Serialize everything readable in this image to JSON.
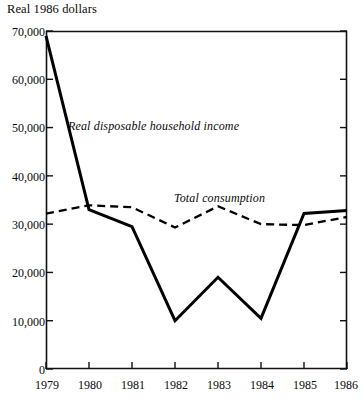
{
  "chart_data": {
    "type": "line",
    "title": "",
    "subtitle": "",
    "ylabel": "Real 1986 dollars",
    "xlabel": "",
    "x": [
      1979,
      1980,
      1981,
      1982,
      1983,
      1984,
      1985,
      1986
    ],
    "xtick_labels": [
      "1979",
      "1980",
      "1981",
      "1982",
      "1983",
      "1984",
      "1985",
      "1986"
    ],
    "ytick_labels": [
      "0",
      "10,000",
      "20,000",
      "30,000",
      "40,000",
      "50,000",
      "60,000",
      "70,000"
    ],
    "ytick_values": [
      0,
      10000,
      20000,
      30000,
      40000,
      50000,
      60000,
      70000
    ],
    "ylim": [
      0,
      70000
    ],
    "xlim": [
      1979,
      1986
    ],
    "grid": false,
    "legend_position": "inline-annotation",
    "series": [
      {
        "name": "Real disposable household income",
        "style": "solid",
        "color": "#000000",
        "label_text": "Real disposable household income",
        "values": [
          69000,
          33000,
          29500,
          10000,
          19000,
          10500,
          32200,
          32800
        ]
      },
      {
        "name": "Total consumption",
        "style": "dashed",
        "color": "#000000",
        "label_text": "Total consumption",
        "values": [
          32200,
          33900,
          33500,
          29300,
          33700,
          30000,
          29800,
          31500
        ]
      }
    ]
  },
  "axis": {
    "y_title": "Real 1986 dollars"
  }
}
